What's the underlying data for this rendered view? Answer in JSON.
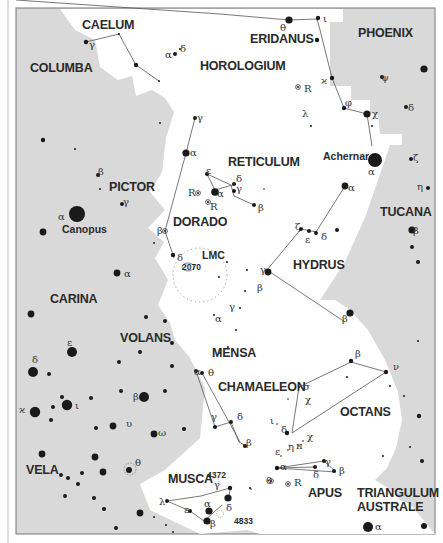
{
  "map": {
    "title": "Southern sky star chart",
    "colors": {
      "background_other": "#d9d9d9",
      "highlight_region": "#ffffff",
      "star": "#1a1a1a",
      "frame": "#888888"
    },
    "constellations": [
      {
        "id": "caelum",
        "label": "CAELUM",
        "x": 82,
        "y": 29
      },
      {
        "id": "columba",
        "label": "COLUMBA",
        "x": 30,
        "y": 72
      },
      {
        "id": "eridanus",
        "label": "ERIDANUS",
        "x": 250,
        "y": 43
      },
      {
        "id": "phoenix",
        "label": "PHOENIX",
        "x": 358,
        "y": 37
      },
      {
        "id": "horologium",
        "label": "HOROLOGIUM",
        "x": 200,
        "y": 70
      },
      {
        "id": "reticulum",
        "label": "RETICULUM",
        "x": 228,
        "y": 166
      },
      {
        "id": "pictor",
        "label": "PICTOR",
        "x": 109,
        "y": 191
      },
      {
        "id": "dorado",
        "label": "DORADO",
        "x": 173,
        "y": 226
      },
      {
        "id": "tucana",
        "label": "TUCANA",
        "x": 380,
        "y": 216
      },
      {
        "id": "hydrus",
        "label": "HYDRUS",
        "x": 293,
        "y": 269
      },
      {
        "id": "carina",
        "label": "CARINA",
        "x": 50,
        "y": 303
      },
      {
        "id": "mensa",
        "label": "MENSA",
        "x": 212,
        "y": 357
      },
      {
        "id": "volans",
        "label": "VOLANS",
        "x": 120,
        "y": 342
      },
      {
        "id": "chamaeleon",
        "label": "CHAMAELEON",
        "x": 218,
        "y": 391
      },
      {
        "id": "octans",
        "label": "OCTANS",
        "x": 340,
        "y": 416
      },
      {
        "id": "vela",
        "label": "VELA",
        "x": 26,
        "y": 474
      },
      {
        "id": "musca",
        "label": "MUSCA",
        "x": 168,
        "y": 483
      },
      {
        "id": "apus",
        "label": "APUS",
        "x": 308,
        "y": 497
      },
      {
        "id": "triangulum-australe-1",
        "label": "TRIANGULUM",
        "x": 357,
        "y": 497
      },
      {
        "id": "triangulum-australe-2",
        "label": "AUSTRALE",
        "x": 357,
        "y": 511
      }
    ],
    "named_stars": [
      {
        "id": "canopus",
        "label": "Canopus",
        "x": 62,
        "y": 233
      },
      {
        "id": "achernar",
        "label": "Achernar",
        "x": 323,
        "y": 160
      }
    ],
    "deep_sky": [
      {
        "id": "lmc",
        "label": "LMC",
        "x": 202,
        "y": 259
      },
      {
        "id": "ngc2070",
        "label": "2070",
        "x": 182,
        "y": 270
      },
      {
        "id": "ngc4372",
        "label": "4372",
        "x": 207,
        "y": 478
      },
      {
        "id": "ngc4833",
        "label": "4833",
        "x": 234,
        "y": 524
      }
    ],
    "star_labels": [
      {
        "t": "γ",
        "x": 89,
        "y": 48
      },
      {
        "t": "α",
        "x": 165,
        "y": 58
      },
      {
        "t": "δ",
        "x": 180,
        "y": 52
      },
      {
        "t": "θ",
        "x": 280,
        "y": 31
      },
      {
        "t": "ι",
        "x": 323,
        "y": 22
      },
      {
        "t": "ϰ",
        "x": 321,
        "y": 84
      },
      {
        "t": "R",
        "x": 304,
        "y": 92
      },
      {
        "t": "ψ",
        "x": 381,
        "y": 81
      },
      {
        "t": "φ",
        "x": 345,
        "y": 106
      },
      {
        "t": "χ",
        "x": 372,
        "y": 117
      },
      {
        "t": "δ",
        "x": 408,
        "y": 111
      },
      {
        "t": "λ",
        "x": 302,
        "y": 117
      },
      {
        "t": "γ",
        "x": 197,
        "y": 121
      },
      {
        "t": "α",
        "x": 190,
        "y": 156
      },
      {
        "t": "α",
        "x": 368,
        "y": 175
      },
      {
        "t": "ζ",
        "x": 413,
        "y": 161
      },
      {
        "t": "α",
        "x": 348,
        "y": 191
      },
      {
        "t": "η",
        "x": 417,
        "y": 190
      },
      {
        "t": "ε",
        "x": 206,
        "y": 174
      },
      {
        "t": "δ",
        "x": 236,
        "y": 182
      },
      {
        "t": "γ",
        "x": 236,
        "y": 192
      },
      {
        "t": "R",
        "x": 188,
        "y": 196
      },
      {
        "t": "α",
        "x": 217,
        "y": 197
      },
      {
        "t": "R",
        "x": 210,
        "y": 210
      },
      {
        "t": "β",
        "x": 258,
        "y": 211
      },
      {
        "t": "β",
        "x": 98,
        "y": 175
      },
      {
        "t": "γ",
        "x": 123,
        "y": 205
      },
      {
        "t": "α",
        "x": 58,
        "y": 220
      },
      {
        "t": "ζ",
        "x": 295,
        "y": 230
      },
      {
        "t": "ε",
        "x": 305,
        "y": 243
      },
      {
        "t": "δ",
        "x": 321,
        "y": 240
      },
      {
        "t": "β",
        "x": 413,
        "y": 234
      },
      {
        "t": "β",
        "x": 157,
        "y": 234
      },
      {
        "t": "δ",
        "x": 177,
        "y": 261
      },
      {
        "t": "α",
        "x": 124,
        "y": 277
      },
      {
        "t": "γ",
        "x": 260,
        "y": 273
      },
      {
        "t": "β",
        "x": 257,
        "y": 291
      },
      {
        "t": "γ",
        "x": 229,
        "y": 310
      },
      {
        "t": "α",
        "x": 215,
        "y": 322
      },
      {
        "t": "β",
        "x": 342,
        "y": 322
      },
      {
        "t": "ε",
        "x": 67,
        "y": 346
      },
      {
        "t": "δ",
        "x": 32,
        "y": 363
      },
      {
        "t": "α",
        "x": 194,
        "y": 375
      },
      {
        "t": "θ",
        "x": 208,
        "y": 376
      },
      {
        "t": "β",
        "x": 355,
        "y": 357
      },
      {
        "t": "ν",
        "x": 393,
        "y": 370
      },
      {
        "t": "σ",
        "x": 303,
        "y": 390
      },
      {
        "t": "χ",
        "x": 305,
        "y": 403
      },
      {
        "t": "β",
        "x": 133,
        "y": 400
      },
      {
        "t": "γ",
        "x": 211,
        "y": 420
      },
      {
        "t": "δ",
        "x": 237,
        "y": 420
      },
      {
        "t": "ι",
        "x": 75,
        "y": 409
      },
      {
        "t": "ϰ",
        "x": 19,
        "y": 413
      },
      {
        "t": "υ",
        "x": 126,
        "y": 427
      },
      {
        "t": "ω",
        "x": 158,
        "y": 436
      },
      {
        "t": "ι",
        "x": 270,
        "y": 424
      },
      {
        "t": "δ",
        "x": 281,
        "y": 433
      },
      {
        "t": "β",
        "x": 246,
        "y": 446
      },
      {
        "t": "χ",
        "x": 307,
        "y": 440
      },
      {
        "t": "η",
        "x": 288,
        "y": 450
      },
      {
        "t": "π",
        "x": 296,
        "y": 449
      },
      {
        "t": "ε",
        "x": 275,
        "y": 455
      },
      {
        "t": "θ",
        "x": 135,
        "y": 466
      },
      {
        "t": "γ",
        "x": 325,
        "y": 465
      },
      {
        "t": "α",
        "x": 280,
        "y": 470
      },
      {
        "t": "β",
        "x": 339,
        "y": 474
      },
      {
        "t": "δ",
        "x": 313,
        "y": 478
      },
      {
        "t": "θ",
        "x": 266,
        "y": 484
      },
      {
        "t": "R",
        "x": 294,
        "y": 486
      },
      {
        "t": "γ",
        "x": 214,
        "y": 488
      },
      {
        "t": "λ",
        "x": 159,
        "y": 505
      },
      {
        "t": "α",
        "x": 204,
        "y": 507
      },
      {
        "t": "δ",
        "x": 226,
        "y": 511
      },
      {
        "t": "ε",
        "x": 184,
        "y": 513
      },
      {
        "t": "β",
        "x": 210,
        "y": 527
      },
      {
        "t": "α",
        "x": 375,
        "y": 530
      }
    ]
  }
}
